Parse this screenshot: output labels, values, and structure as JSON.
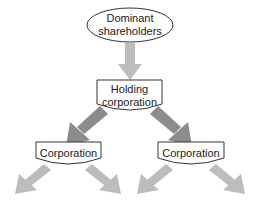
{
  "diagram": {
    "type": "hierarchy",
    "nodes": {
      "top": {
        "line1": "Dominant",
        "line2": "shareholders",
        "shape": "ellipse"
      },
      "holding": {
        "line1": "Holding",
        "line2": "corporation",
        "shape": "document"
      },
      "left": {
        "label": "Corporation",
        "shape": "document"
      },
      "right": {
        "label": "Corporation",
        "shape": "document"
      }
    },
    "colors": {
      "light_arrow": "#bdbdbd",
      "dark_arrow": "#8c8c8c",
      "outline": "#333333"
    }
  }
}
